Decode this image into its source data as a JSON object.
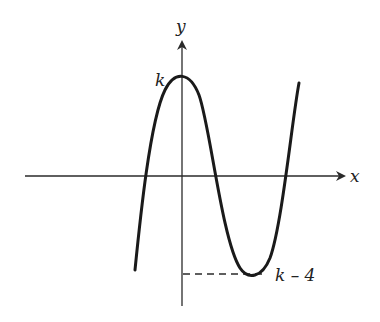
{
  "figure": {
    "type": "function-graph",
    "axes": {
      "x_label": "x",
      "y_label": "y"
    },
    "annotations": {
      "max_label": "k",
      "min_label": "k – 4"
    },
    "colors": {
      "curve": "#1a1a1a",
      "axes": "#2a2a2a",
      "background": "#ffffff"
    }
  }
}
